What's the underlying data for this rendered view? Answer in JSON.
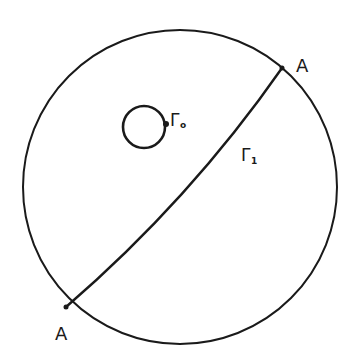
{
  "diagram": {
    "colors": {
      "stroke": "#1a1a1a",
      "background": "#ffffff"
    },
    "outer_circle": {
      "cx": 180,
      "cy": 187,
      "r": 157
    },
    "inner_loop": {
      "cx": 144,
      "cy": 127,
      "r": 21,
      "label": "Γ",
      "subscript": "o"
    },
    "arc": {
      "label": "Γ",
      "subscript": "1"
    },
    "points": [
      {
        "label": "A",
        "x": 282,
        "y": 68
      },
      {
        "label": "A",
        "x": 66,
        "y": 307
      }
    ]
  }
}
